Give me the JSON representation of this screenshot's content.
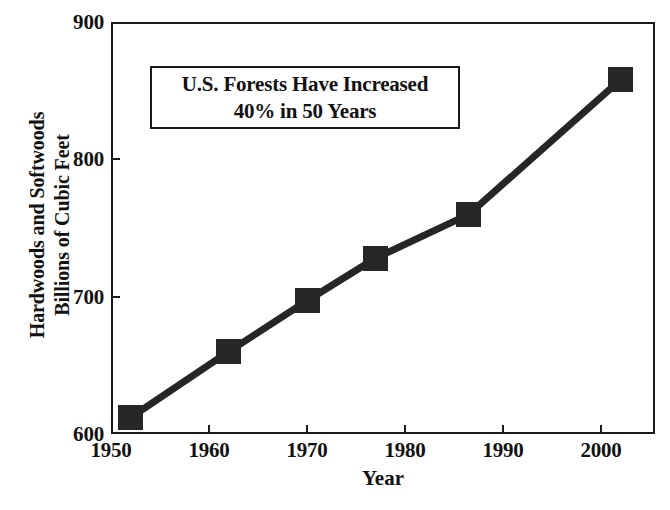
{
  "chart_data": {
    "type": "line",
    "title": "",
    "xlabel": "Year",
    "ylabel": "Hardwoods and Softwoods Billions of Cubic Feet",
    "ylabel_lines": [
      "Hardwoods and Softwoods",
      "Billions of Cubic Feet"
    ],
    "xlim": [
      1950,
      2005.5
    ],
    "ylim": [
      600,
      900
    ],
    "xticks": [
      1950,
      1960,
      1970,
      1980,
      1990,
      2000
    ],
    "xtick_labels": [
      "1950",
      "1960",
      "1970",
      "1980",
      "1990",
      "2000"
    ],
    "yticks": [
      600,
      700,
      800,
      900
    ],
    "ytick_labels": [
      "600",
      "700",
      "800",
      "900"
    ],
    "grid": false,
    "legend": "none",
    "marker": "filled-square",
    "line_color": "#262626",
    "marker_color": "#262626",
    "x": [
      1952,
      1962,
      1970,
      1977,
      1986.5,
      2002
    ],
    "values": [
      612,
      660,
      697,
      728,
      760,
      858
    ],
    "series": [
      {
        "name": "Hardwoods and Softwoods",
        "points": [
          {
            "x": 1952,
            "y": 612
          },
          {
            "x": 1962,
            "y": 660
          },
          {
            "x": 1970,
            "y": 697
          },
          {
            "x": 1977,
            "y": 728
          },
          {
            "x": 1986.5,
            "y": 760
          },
          {
            "x": 2002,
            "y": 858
          }
        ]
      }
    ],
    "annotations": [
      {
        "name": "callout-box",
        "lines": [
          "U.S. Forests Have Increased",
          "40% in 50 Years"
        ]
      }
    ]
  }
}
